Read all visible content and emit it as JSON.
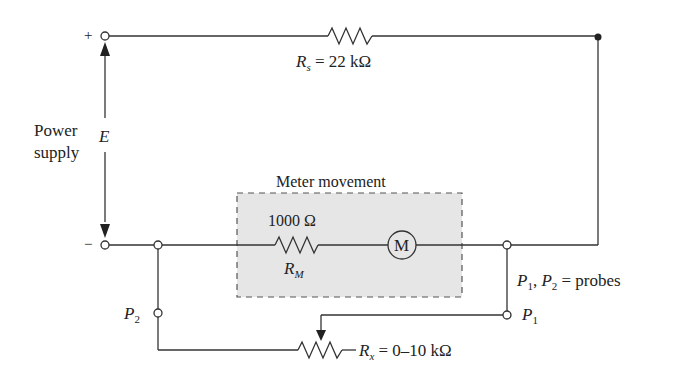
{
  "diagram": {
    "power_supply": {
      "label_line1": "Power",
      "label_line2": "supply",
      "voltage_symbol": "E",
      "plus_sign": "+",
      "minus_sign": "−"
    },
    "series_resistor": {
      "symbol": "R",
      "subscript": "s",
      "value": "= 22 kΩ"
    },
    "meter_movement": {
      "box_label": "Meter movement",
      "resistor_value": "1000 Ω",
      "resistor_symbol": "R",
      "resistor_subscript": "M",
      "meter_glyph": "M"
    },
    "probes": {
      "p1_symbol": "P",
      "p1_sub": "1",
      "p2_symbol": "P",
      "p2_sub": "2",
      "legend_p1": "P",
      "legend_p1_sub": "1",
      "legend_sep": ", ",
      "legend_p2": "P",
      "legend_p2_sub": "2",
      "legend_text": " = probes"
    },
    "unknown_resistor": {
      "symbol": "R",
      "subscript": "x",
      "value": "= 0–10 kΩ"
    },
    "colors": {
      "line": "#333333",
      "box_fill": "#e6e6e6",
      "box_border": "#555555"
    }
  }
}
